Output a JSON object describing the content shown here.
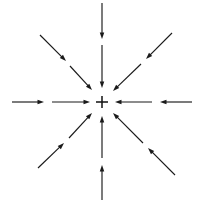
{
  "figure": {
    "background_color": "#ffffff",
    "line_color": "#1a1a1a",
    "center_marker": {
      "type": "plus",
      "x": 102,
      "y": 102,
      "arm_length": 6,
      "color": "#111111"
    },
    "canvas": {
      "width": 202,
      "height": 205
    }
  },
  "chart_data": {
    "type": "scatter",
    "xlabel": "",
    "ylabel": "",
    "grid": false,
    "legend": null,
    "xlim": [
      0,
      202
    ],
    "ylim": [
      0,
      205
    ],
    "field_center": [
      102,
      102
    ],
    "direction_count": 8,
    "segments_per_direction": 2,
    "flow": "inward",
    "arrowhead_length": 6.5,
    "arrowhead_width": 4.5,
    "vectors": [
      {
        "name": "north-outer",
        "direction": "N",
        "angle_deg": 90,
        "tail": [
          102,
          3
        ],
        "head": [
          102,
          39
        ],
        "points_toward_center": true
      },
      {
        "name": "north-inner",
        "direction": "N",
        "angle_deg": 90,
        "tail": [
          102,
          45
        ],
        "head": [
          102,
          88
        ],
        "points_toward_center": true
      },
      {
        "name": "northeast-outer",
        "direction": "NE",
        "angle_deg": 45,
        "tail": [
          172,
          33
        ],
        "head": [
          146,
          59
        ],
        "points_toward_center": true
      },
      {
        "name": "northeast-inner",
        "direction": "NE",
        "angle_deg": 45,
        "tail": [
          141,
          64
        ],
        "head": [
          113,
          91
        ],
        "points_toward_center": true
      },
      {
        "name": "east-outer",
        "direction": "E",
        "angle_deg": 0,
        "tail": [
          192,
          102
        ],
        "head": [
          160,
          102
        ],
        "points_toward_center": true
      },
      {
        "name": "east-inner",
        "direction": "E",
        "angle_deg": 0,
        "tail": [
          152,
          102
        ],
        "head": [
          115,
          102
        ],
        "points_toward_center": true
      },
      {
        "name": "southeast-outer",
        "direction": "SE",
        "angle_deg": 315,
        "tail": [
          175,
          175
        ],
        "head": [
          148,
          148
        ],
        "points_toward_center": true
      },
      {
        "name": "southeast-inner",
        "direction": "SE",
        "angle_deg": 315,
        "tail": [
          143,
          143
        ],
        "head": [
          113,
          113
        ],
        "points_toward_center": true
      },
      {
        "name": "south-outer",
        "direction": "S",
        "angle_deg": 270,
        "tail": [
          102,
          200
        ],
        "head": [
          102,
          165
        ],
        "points_toward_center": true
      },
      {
        "name": "south-inner",
        "direction": "S",
        "angle_deg": 270,
        "tail": [
          102,
          158
        ],
        "head": [
          102,
          116
        ],
        "points_toward_center": true
      },
      {
        "name": "southwest-outer",
        "direction": "SW",
        "angle_deg": 225,
        "tail": [
          38,
          168
        ],
        "head": [
          64,
          143
        ],
        "points_toward_center": true
      },
      {
        "name": "southwest-inner",
        "direction": "SW",
        "angle_deg": 225,
        "tail": [
          69,
          138
        ],
        "head": [
          92,
          113
        ],
        "points_toward_center": true
      },
      {
        "name": "west-outer",
        "direction": "W",
        "angle_deg": 180,
        "tail": [
          12,
          102
        ],
        "head": [
          44,
          102
        ],
        "points_toward_center": true
      },
      {
        "name": "west-inner",
        "direction": "W",
        "angle_deg": 180,
        "tail": [
          52,
          102
        ],
        "head": [
          90,
          102
        ],
        "points_toward_center": true
      },
      {
        "name": "northwest-outer",
        "direction": "NW",
        "angle_deg": 135,
        "tail": [
          40,
          35
        ],
        "head": [
          66,
          61
        ],
        "points_toward_center": true
      },
      {
        "name": "northwest-inner",
        "direction": "NW",
        "angle_deg": 135,
        "tail": [
          70,
          66
        ],
        "head": [
          92,
          90
        ],
        "points_toward_center": true
      }
    ]
  }
}
